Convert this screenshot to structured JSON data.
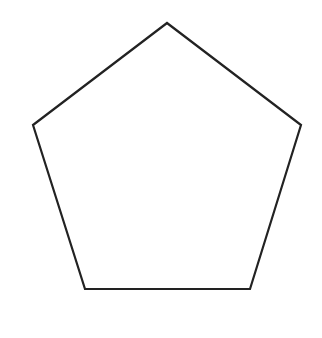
{
  "diagram": {
    "shape": "pentagon",
    "stroke_color": "#222222",
    "fill_color": "#ffffff",
    "stroke_width": 2.2,
    "vertices": [
      [
        167,
        23
      ],
      [
        301,
        125
      ],
      [
        250,
        289
      ],
      [
        85,
        289
      ],
      [
        33,
        125
      ]
    ]
  }
}
